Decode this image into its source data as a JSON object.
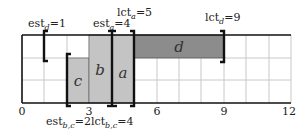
{
  "diagram": {
    "title": "",
    "scale": {
      "x0_px": 22,
      "px_per_unit": 22.4,
      "x_min": 0,
      "x_max": 12
    },
    "rows_px": {
      "top": 35,
      "row1": 58,
      "row2": 80,
      "bottom": 103
    },
    "colors": {
      "grid": "#c8c8c8",
      "axis": "#111111",
      "task_light": "#c4c4c4",
      "task_dark": "#8c8c8c",
      "bracket": "#111111"
    },
    "x_ticks": [
      {
        "value": 0,
        "label": "0"
      },
      {
        "value": 3,
        "label": "3"
      },
      {
        "value": 6,
        "label": "6"
      },
      {
        "value": 9,
        "label": "9"
      },
      {
        "value": 12,
        "label": "12"
      }
    ],
    "tasks": [
      {
        "id": "c",
        "label": "c",
        "start": 2,
        "end": 3,
        "top_row": "row1",
        "shade": "task_light"
      },
      {
        "id": "b",
        "label": "b",
        "start": 3,
        "end": 4,
        "top_row": "top",
        "shade": "task_light"
      },
      {
        "id": "a",
        "label": "a",
        "start": 4,
        "end": 5,
        "top_row": "top",
        "shade": "task_light"
      },
      {
        "id": "d",
        "label": "d",
        "start": 5,
        "end": 9,
        "top_row": "top",
        "bottom_row": "row1",
        "shade": "task_dark"
      }
    ],
    "annotations": {
      "est_d": {
        "text": "est",
        "sub": "d",
        "value": "=1"
      },
      "est_a": {
        "text": "est",
        "sub": "a",
        "value": "=4"
      },
      "lct_a": {
        "text": "lct",
        "sub": "a",
        "value": "=5"
      },
      "lct_d": {
        "text": "lct",
        "sub": "d",
        "value": "=9"
      },
      "est_bc": {
        "text": "est",
        "sub": "b,c",
        "value": "=2"
      },
      "lct_bc": {
        "text": "lct",
        "sub": "b,c",
        "value": "=4"
      }
    }
  }
}
